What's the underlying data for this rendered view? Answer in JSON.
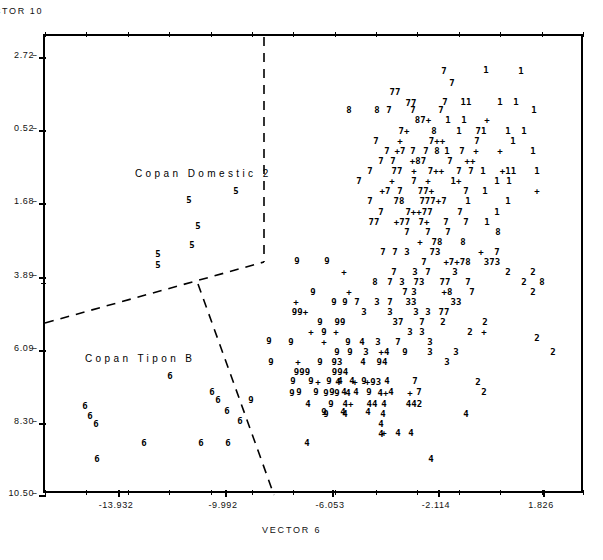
{
  "figure": {
    "y_axis_title": "CTOR  10",
    "x_axis_title": "VECTOR   6"
  },
  "chart_data": {
    "type": "scatter",
    "title": "",
    "xlabel": "VECTOR   6",
    "ylabel": "CTOR  10",
    "xlim": [
      -15.65,
      3.42
    ],
    "ylim": [
      -10.5,
      2.72
    ],
    "grid": false,
    "legend": "none",
    "xticks": [
      "-13.932",
      "-9.992",
      "-6.053",
      "-2.114",
      "1.826"
    ],
    "xtick_values": [
      -13.932,
      -9.992,
      -6.053,
      -2.114,
      1.826
    ],
    "yticks": [
      "2.72",
      "0.52",
      "1.68",
      "3.89",
      "6.09",
      "8.30",
      "10.50"
    ],
    "ytick_values": [
      2.72,
      0.52,
      -1.68,
      -3.89,
      -6.09,
      -8.3,
      -10.5
    ],
    "ytick_dashes": "--",
    "annotations": [
      {
        "text": "Copan Domestic 2",
        "x": 135,
        "y": 168
      },
      {
        "text": "Copan Tipon B",
        "x": 85,
        "y": 353
      }
    ],
    "boundaries": [
      {
        "name": "vertical-divider",
        "points": [
          [
            262,
            35
          ],
          [
            262,
            260
          ]
        ],
        "style": "dashed"
      },
      {
        "name": "upper-left-diagonal",
        "points": [
          [
            43,
            321
          ],
          [
            262,
            260
          ]
        ],
        "style": "dashed"
      },
      {
        "name": "lower-right-diagonal",
        "points": [
          [
            196,
            282
          ],
          [
            272,
            493
          ]
        ],
        "style": "dashed"
      }
    ],
    "symbols": [
      "1",
      "2",
      "3",
      "4",
      "5",
      "6",
      "7",
      "8",
      "9",
      "+"
    ],
    "points": [
      {
        "s": "7",
        "x": 444,
        "y": 71
      },
      {
        "s": "1",
        "x": 486,
        "y": 70
      },
      {
        "s": "1",
        "x": 521,
        "y": 71
      },
      {
        "s": "7",
        "x": 452,
        "y": 83
      },
      {
        "s": "77",
        "x": 395,
        "y": 92
      },
      {
        "s": "77",
        "x": 411,
        "y": 103
      },
      {
        "s": "7",
        "x": 445,
        "y": 102
      },
      {
        "s": "11",
        "x": 466,
        "y": 102
      },
      {
        "s": "1",
        "x": 500,
        "y": 102
      },
      {
        "s": "1",
        "x": 516,
        "y": 102
      },
      {
        "s": "8",
        "x": 349,
        "y": 110
      },
      {
        "s": "8",
        "x": 377,
        "y": 110
      },
      {
        "s": "7",
        "x": 389,
        "y": 110
      },
      {
        "s": "7",
        "x": 413,
        "y": 110
      },
      {
        "s": "7",
        "x": 441,
        "y": 110
      },
      {
        "s": "1",
        "x": 534,
        "y": 110
      },
      {
        "s": "87+",
        "x": 423,
        "y": 120
      },
      {
        "s": "1",
        "x": 448,
        "y": 120
      },
      {
        "s": "1",
        "x": 464,
        "y": 120
      },
      {
        "s": "+",
        "x": 487,
        "y": 120
      },
      {
        "s": "7+",
        "x": 404,
        "y": 131
      },
      {
        "s": "8",
        "x": 434,
        "y": 131
      },
      {
        "s": "1",
        "x": 459,
        "y": 131
      },
      {
        "s": "71",
        "x": 481,
        "y": 131
      },
      {
        "s": "1",
        "x": 508,
        "y": 131
      },
      {
        "s": "1",
        "x": 524,
        "y": 131
      },
      {
        "s": "7",
        "x": 376,
        "y": 141
      },
      {
        "s": "+",
        "x": 400,
        "y": 141
      },
      {
        "s": "7++",
        "x": 437,
        "y": 141
      },
      {
        "s": "7",
        "x": 477,
        "y": 141
      },
      {
        "s": "1",
        "x": 513,
        "y": 141
      },
      {
        "s": "7",
        "x": 387,
        "y": 151
      },
      {
        "s": "+7",
        "x": 400,
        "y": 151
      },
      {
        "s": "7",
        "x": 413,
        "y": 151
      },
      {
        "s": "7",
        "x": 426,
        "y": 151
      },
      {
        "s": "8",
        "x": 437,
        "y": 151
      },
      {
        "s": "1",
        "x": 447,
        "y": 151
      },
      {
        "s": "7",
        "x": 462,
        "y": 151
      },
      {
        "s": "+",
        "x": 476,
        "y": 151
      },
      {
        "s": "+",
        "x": 500,
        "y": 151
      },
      {
        "s": "1",
        "x": 533,
        "y": 151
      },
      {
        "s": "7",
        "x": 381,
        "y": 161
      },
      {
        "s": "7",
        "x": 393,
        "y": 161
      },
      {
        "s": "+87",
        "x": 418,
        "y": 161
      },
      {
        "s": "7",
        "x": 450,
        "y": 161
      },
      {
        "s": "++",
        "x": 470,
        "y": 161
      },
      {
        "s": "7",
        "x": 370,
        "y": 171
      },
      {
        "s": "77",
        "x": 397,
        "y": 171
      },
      {
        "s": "+",
        "x": 414,
        "y": 171
      },
      {
        "s": "7++",
        "x": 436,
        "y": 171
      },
      {
        "s": "7",
        "x": 459,
        "y": 171
      },
      {
        "s": "7",
        "x": 471,
        "y": 171
      },
      {
        "s": "1",
        "x": 483,
        "y": 171
      },
      {
        "s": "+11",
        "x": 508,
        "y": 171
      },
      {
        "s": "1",
        "x": 537,
        "y": 171
      },
      {
        "s": "7",
        "x": 359,
        "y": 181
      },
      {
        "s": "+",
        "x": 392,
        "y": 181
      },
      {
        "s": "7",
        "x": 414,
        "y": 181
      },
      {
        "s": "+",
        "x": 428,
        "y": 181
      },
      {
        "s": "1+",
        "x": 456,
        "y": 181
      },
      {
        "s": "1",
        "x": 497,
        "y": 181
      },
      {
        "s": "1",
        "x": 509,
        "y": 181
      },
      {
        "s": "+7",
        "x": 385,
        "y": 191
      },
      {
        "s": "7",
        "x": 400,
        "y": 191
      },
      {
        "s": "77+",
        "x": 426,
        "y": 191
      },
      {
        "s": "7",
        "x": 466,
        "y": 191
      },
      {
        "s": "1",
        "x": 485,
        "y": 191
      },
      {
        "s": "+",
        "x": 537,
        "y": 191
      },
      {
        "s": "7",
        "x": 370,
        "y": 201
      },
      {
        "s": "78",
        "x": 399,
        "y": 201
      },
      {
        "s": "777+7",
        "x": 433,
        "y": 201
      },
      {
        "s": "1",
        "x": 468,
        "y": 201
      },
      {
        "s": "1",
        "x": 508,
        "y": 201
      },
      {
        "s": "7",
        "x": 381,
        "y": 212
      },
      {
        "s": "7++77",
        "x": 419,
        "y": 212
      },
      {
        "s": "7",
        "x": 460,
        "y": 212
      },
      {
        "s": "1",
        "x": 497,
        "y": 212
      },
      {
        "s": "77",
        "x": 374,
        "y": 222
      },
      {
        "s": "+77",
        "x": 402,
        "y": 222
      },
      {
        "s": "7+",
        "x": 424,
        "y": 222
      },
      {
        "s": "7",
        "x": 446,
        "y": 222
      },
      {
        "s": "7",
        "x": 466,
        "y": 222
      },
      {
        "s": "1",
        "x": 487,
        "y": 222
      },
      {
        "s": "7",
        "x": 407,
        "y": 232
      },
      {
        "s": "7",
        "x": 428,
        "y": 232
      },
      {
        "s": "7",
        "x": 448,
        "y": 232
      },
      {
        "s": "8",
        "x": 498,
        "y": 232
      },
      {
        "s": "+",
        "x": 420,
        "y": 242
      },
      {
        "s": "78",
        "x": 437,
        "y": 242
      },
      {
        "s": "8",
        "x": 463,
        "y": 242
      },
      {
        "s": "7",
        "x": 383,
        "y": 252
      },
      {
        "s": "7",
        "x": 395,
        "y": 252
      },
      {
        "s": "3",
        "x": 407,
        "y": 252
      },
      {
        "s": "73",
        "x": 435,
        "y": 252
      },
      {
        "s": "+",
        "x": 481,
        "y": 252
      },
      {
        "s": "7",
        "x": 497,
        "y": 252
      },
      {
        "s": "7",
        "x": 424,
        "y": 262
      },
      {
        "s": "+7+78",
        "x": 457,
        "y": 262
      },
      {
        "s": "373",
        "x": 492,
        "y": 262
      },
      {
        "s": "9",
        "x": 327,
        "y": 261
      },
      {
        "s": "9",
        "x": 297,
        "y": 261
      },
      {
        "s": "7",
        "x": 394,
        "y": 272
      },
      {
        "s": "3",
        "x": 415,
        "y": 272
      },
      {
        "s": "7",
        "x": 428,
        "y": 272
      },
      {
        "s": "3",
        "x": 455,
        "y": 272
      },
      {
        "s": "2",
        "x": 508,
        "y": 272
      },
      {
        "s": "2",
        "x": 533,
        "y": 272
      },
      {
        "s": "8",
        "x": 375,
        "y": 282
      },
      {
        "s": "7",
        "x": 390,
        "y": 282
      },
      {
        "s": "3",
        "x": 402,
        "y": 282
      },
      {
        "s": "73",
        "x": 419,
        "y": 282
      },
      {
        "s": "77",
        "x": 445,
        "y": 282
      },
      {
        "s": "7",
        "x": 468,
        "y": 282
      },
      {
        "s": "2",
        "x": 524,
        "y": 282
      },
      {
        "s": "8",
        "x": 542,
        "y": 282
      },
      {
        "s": "+",
        "x": 344,
        "y": 272
      },
      {
        "s": "3",
        "x": 414,
        "y": 292
      },
      {
        "s": "+8",
        "x": 447,
        "y": 292
      },
      {
        "s": "2",
        "x": 533,
        "y": 292
      },
      {
        "s": "9",
        "x": 313,
        "y": 292
      },
      {
        "s": "+",
        "x": 349,
        "y": 292
      },
      {
        "s": "7",
        "x": 405,
        "y": 292
      },
      {
        "s": "7",
        "x": 472,
        "y": 292
      },
      {
        "s": "+",
        "x": 296,
        "y": 302
      },
      {
        "s": "9",
        "x": 334,
        "y": 302
      },
      {
        "s": "9",
        "x": 345,
        "y": 302
      },
      {
        "s": "7",
        "x": 357,
        "y": 302
      },
      {
        "s": "3",
        "x": 377,
        "y": 302
      },
      {
        "s": "7",
        "x": 390,
        "y": 302
      },
      {
        "s": "33",
        "x": 411,
        "y": 302
      },
      {
        "s": "33",
        "x": 456,
        "y": 302
      },
      {
        "s": "99+",
        "x": 300,
        "y": 312
      },
      {
        "s": "3",
        "x": 364,
        "y": 312
      },
      {
        "s": "3",
        "x": 390,
        "y": 312
      },
      {
        "s": "3",
        "x": 416,
        "y": 312
      },
      {
        "s": "3",
        "x": 428,
        "y": 312
      },
      {
        "s": "77",
        "x": 444,
        "y": 312
      },
      {
        "s": "9",
        "x": 320,
        "y": 322
      },
      {
        "s": "99",
        "x": 340,
        "y": 322
      },
      {
        "s": "37",
        "x": 398,
        "y": 322
      },
      {
        "s": "7",
        "x": 422,
        "y": 322
      },
      {
        "s": "2",
        "x": 443,
        "y": 322
      },
      {
        "s": "2",
        "x": 485,
        "y": 322
      },
      {
        "s": "+",
        "x": 311,
        "y": 332
      },
      {
        "s": "9",
        "x": 324,
        "y": 332
      },
      {
        "s": "+",
        "x": 336,
        "y": 332
      },
      {
        "s": "3",
        "x": 410,
        "y": 332
      },
      {
        "s": "3",
        "x": 422,
        "y": 332
      },
      {
        "s": "2",
        "x": 470,
        "y": 332
      },
      {
        "s": "+",
        "x": 484,
        "y": 332
      },
      {
        "s": "9",
        "x": 291,
        "y": 342
      },
      {
        "s": "+",
        "x": 324,
        "y": 342
      },
      {
        "s": "9",
        "x": 348,
        "y": 342
      },
      {
        "s": "4",
        "x": 362,
        "y": 342
      },
      {
        "s": "3",
        "x": 378,
        "y": 342
      },
      {
        "s": "7",
        "x": 398,
        "y": 342
      },
      {
        "s": "3",
        "x": 430,
        "y": 342
      },
      {
        "s": "9",
        "x": 337,
        "y": 352
      },
      {
        "s": "9",
        "x": 350,
        "y": 352
      },
      {
        "s": "3",
        "x": 366,
        "y": 352
      },
      {
        "s": "+4",
        "x": 384,
        "y": 352
      },
      {
        "s": "9",
        "x": 405,
        "y": 352
      },
      {
        "s": "3",
        "x": 430,
        "y": 352
      },
      {
        "s": "3",
        "x": 456,
        "y": 352
      },
      {
        "s": "2",
        "x": 553,
        "y": 352
      },
      {
        "s": "+",
        "x": 298,
        "y": 362
      },
      {
        "s": "9",
        "x": 320,
        "y": 362
      },
      {
        "s": "93",
        "x": 337,
        "y": 362
      },
      {
        "s": "4",
        "x": 363,
        "y": 362
      },
      {
        "s": "94",
        "x": 382,
        "y": 362
      },
      {
        "s": "3",
        "x": 447,
        "y": 362
      },
      {
        "s": "9",
        "x": 271,
        "y": 362
      },
      {
        "s": "999",
        "x": 302,
        "y": 372
      },
      {
        "s": "994",
        "x": 340,
        "y": 372
      },
      {
        "s": "+",
        "x": 318,
        "y": 382
      },
      {
        "s": "4",
        "x": 338,
        "y": 382
      },
      {
        "s": "+",
        "x": 355,
        "y": 382
      },
      {
        "s": "+93",
        "x": 373,
        "y": 382
      },
      {
        "s": "2",
        "x": 478,
        "y": 382
      },
      {
        "s": "9",
        "x": 299,
        "y": 392
      },
      {
        "s": "9",
        "x": 316,
        "y": 392
      },
      {
        "s": "9",
        "x": 332,
        "y": 392
      },
      {
        "s": "4",
        "x": 344,
        "y": 392
      },
      {
        "s": "4",
        "x": 356,
        "y": 392
      },
      {
        "s": "9",
        "x": 369,
        "y": 392
      },
      {
        "s": "4",
        "x": 391,
        "y": 392
      },
      {
        "s": "7",
        "x": 419,
        "y": 392
      },
      {
        "s": "2",
        "x": 484,
        "y": 392
      },
      {
        "s": "9",
        "x": 293,
        "y": 381
      },
      {
        "s": "9",
        "x": 311,
        "y": 381
      },
      {
        "s": "9",
        "x": 329,
        "y": 381
      },
      {
        "s": "4",
        "x": 340,
        "y": 381
      },
      {
        "s": "4",
        "x": 352,
        "y": 381
      },
      {
        "s": "9",
        "x": 364,
        "y": 381
      },
      {
        "s": "4",
        "x": 387,
        "y": 381
      },
      {
        "s": "7",
        "x": 415,
        "y": 381
      },
      {
        "s": "9",
        "x": 292,
        "y": 393
      },
      {
        "s": "9",
        "x": 326,
        "y": 393
      },
      {
        "s": "9",
        "x": 337,
        "y": 393
      },
      {
        "s": "4",
        "x": 348,
        "y": 393
      },
      {
        "s": "4+",
        "x": 383,
        "y": 393
      },
      {
        "s": "+",
        "x": 410,
        "y": 393
      },
      {
        "s": "4",
        "x": 308,
        "y": 404
      },
      {
        "s": "9",
        "x": 331,
        "y": 404
      },
      {
        "s": "4+",
        "x": 348,
        "y": 404
      },
      {
        "s": "44",
        "x": 372,
        "y": 404
      },
      {
        "s": "4",
        "x": 384,
        "y": 404
      },
      {
        "s": "442",
        "x": 414,
        "y": 404
      },
      {
        "s": "4",
        "x": 383,
        "y": 414
      },
      {
        "s": "4",
        "x": 466,
        "y": 414
      },
      {
        "s": "9",
        "x": 326,
        "y": 414
      },
      {
        "s": "4",
        "x": 345,
        "y": 414
      },
      {
        "s": "9",
        "x": 324,
        "y": 412
      },
      {
        "s": "4",
        "x": 343,
        "y": 412
      },
      {
        "s": "4",
        "x": 368,
        "y": 412
      },
      {
        "s": "4",
        "x": 381,
        "y": 424
      },
      {
        "s": "4",
        "x": 381,
        "y": 434
      },
      {
        "s": "+",
        "x": 384,
        "y": 433
      },
      {
        "s": "4",
        "x": 398,
        "y": 433
      },
      {
        "s": "4",
        "x": 411,
        "y": 433
      },
      {
        "s": "4",
        "x": 307,
        "y": 443
      },
      {
        "s": "4",
        "x": 431,
        "y": 459
      },
      {
        "s": "2",
        "x": 537,
        "y": 338
      },
      {
        "s": "5",
        "x": 236,
        "y": 191
      },
      {
        "s": "5",
        "x": 189,
        "y": 200
      },
      {
        "s": "5",
        "x": 198,
        "y": 226
      },
      {
        "s": "5",
        "x": 192,
        "y": 245
      },
      {
        "s": "5",
        "x": 158,
        "y": 254
      },
      {
        "s": "5",
        "x": 158,
        "y": 265
      },
      {
        "s": "6",
        "x": 170,
        "y": 376
      },
      {
        "s": "6",
        "x": 85,
        "y": 406
      },
      {
        "s": "6",
        "x": 90,
        "y": 416
      },
      {
        "s": "6",
        "x": 96,
        "y": 424
      },
      {
        "s": "6",
        "x": 212,
        "y": 392
      },
      {
        "s": "6",
        "x": 218,
        "y": 400
      },
      {
        "s": "6",
        "x": 227,
        "y": 411
      },
      {
        "s": "6",
        "x": 240,
        "y": 421
      },
      {
        "s": "6",
        "x": 228,
        "y": 443
      },
      {
        "s": "9",
        "x": 251,
        "y": 400
      },
      {
        "s": "6",
        "x": 144,
        "y": 443
      },
      {
        "s": "6",
        "x": 201,
        "y": 443
      },
      {
        "s": "6",
        "x": 97,
        "y": 459
      },
      {
        "s": "9",
        "x": 269,
        "y": 341
      }
    ]
  }
}
